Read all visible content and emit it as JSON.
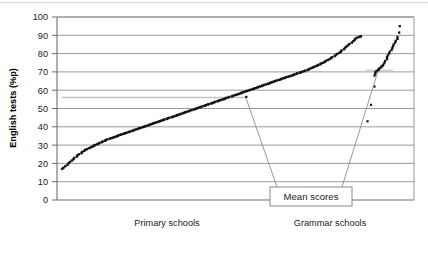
{
  "figure": {
    "background_color": "#ffffff",
    "plot_frame_color": "#808080",
    "gridline_color": "#9a9a9a",
    "marker_color": "#111111",
    "leader_color": "#7a7a7a"
  },
  "chart_data": {
    "type": "scatter",
    "title": "",
    "xlabel": "",
    "ylabel": "English tests (%p)",
    "ylim": [
      0,
      100
    ],
    "ytick_labels": [
      "0",
      "10",
      "20",
      "30",
      "40",
      "50",
      "60",
      "70",
      "80",
      "90",
      "100"
    ],
    "ytick_values": [
      0,
      10,
      20,
      30,
      40,
      50,
      60,
      70,
      80,
      90,
      100
    ],
    "grid": true,
    "grid_axis": "y",
    "legend": "none",
    "x_categories": [
      "Primary schools",
      "Grammar schools"
    ],
    "annotations": [
      {
        "label": "Mean scores",
        "points_to": [
          "primary-mean-marker",
          "grammar-mean-marker"
        ]
      }
    ],
    "series": [
      {
        "name": "Primary schools",
        "marker": "dot",
        "description": "Dense monotonically increasing ranked scatter of primary school scores",
        "values": [
          17.0,
          17.6,
          18.4,
          19.2,
          20.0,
          20.8,
          21.6,
          22.3,
          23.0,
          23.7,
          24.4,
          25.0,
          25.6,
          26.2,
          26.8,
          27.3,
          27.8,
          28.3,
          28.8,
          29.2,
          29.6,
          30.0,
          30.4,
          30.8,
          31.2,
          31.6,
          32.0,
          32.4,
          32.8,
          33.1,
          33.5,
          33.8,
          34.1,
          34.4,
          34.7,
          35.0,
          35.3,
          35.6,
          35.9,
          36.2,
          36.5,
          36.8,
          37.1,
          37.4,
          37.7,
          38.0,
          38.3,
          38.6,
          38.9,
          39.2,
          39.5,
          39.8,
          40.1,
          40.4,
          40.7,
          41.0,
          41.3,
          41.6,
          41.9,
          42.2,
          42.5,
          42.8,
          43.1,
          43.4,
          43.7,
          44.0,
          44.3,
          44.6,
          44.9,
          45.2,
          45.5,
          45.8,
          46.1,
          46.4,
          46.7,
          47.0,
          47.3,
          47.6,
          47.9,
          48.2,
          48.5,
          48.8,
          49.1,
          49.4,
          49.7,
          50.0,
          50.3,
          50.6,
          50.9,
          51.2,
          51.5,
          51.8,
          52.1,
          52.4,
          52.7,
          53.0,
          53.3,
          53.6,
          53.9,
          54.2,
          54.5,
          54.8,
          55.1,
          55.4,
          55.7,
          56.0,
          56.3,
          56.6,
          56.9,
          57.2,
          57.5,
          57.8,
          58.1,
          58.4,
          58.7,
          59.0,
          59.3,
          59.6,
          59.9,
          60.2,
          60.5,
          60.8,
          61.1,
          61.4,
          61.7,
          62.0,
          62.3,
          62.6,
          62.9,
          63.2,
          63.5,
          63.8,
          64.1,
          64.4,
          64.7,
          65.0,
          65.3,
          65.6,
          65.9,
          66.2,
          66.5,
          66.8,
          67.1,
          67.4,
          67.7,
          68.0,
          68.3,
          68.6,
          68.9,
          69.2,
          69.5,
          69.8,
          70.1,
          70.4,
          70.7,
          71.0,
          71.4,
          71.8,
          72.2,
          72.6,
          73.0,
          73.4,
          73.8,
          74.2,
          74.6,
          75.0,
          75.5,
          76.0,
          76.5,
          77.0,
          77.5,
          78.0,
          78.6,
          79.2,
          79.8,
          80.4,
          81.0,
          81.7,
          82.4,
          83.1,
          83.8,
          84.5,
          85.2,
          86.0,
          86.8,
          87.6,
          88.3,
          88.8,
          89.2,
          89.5
        ],
        "mean": 56.0
      },
      {
        "name": "Grammar schools",
        "marker": "dot",
        "description": "Sparse scatter of grammar school scores including three low outliers",
        "values": [
          43.0,
          52.0,
          62.0,
          68.0,
          69.0,
          70.0,
          70.5,
          71.0,
          71.5,
          72.0,
          72.5,
          73.0,
          73.5,
          74.0,
          75.0,
          76.0,
          77.0,
          78.0,
          79.0,
          80.0,
          81.0,
          82.0,
          83.0,
          84.0,
          85.0,
          86.0,
          87.0,
          88.0,
          89.0,
          91.5,
          95.0
        ],
        "mean": 72.0
      }
    ]
  }
}
